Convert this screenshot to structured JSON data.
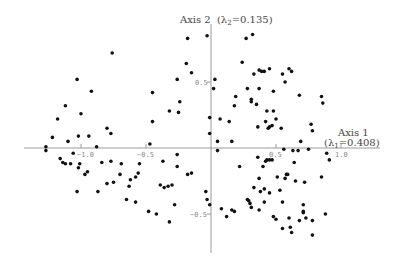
{
  "chart_data": {
    "type": "scatter",
    "title": "",
    "xlabel": "Axis 1",
    "xlabel_sub": "(λ1 = 0.408)",
    "ylabel": "Axis 2 (λ2 = 0.135)",
    "xlim": [
      -1.45,
      1.3
    ],
    "ylim": [
      -0.8,
      0.95
    ],
    "grid": false,
    "legend": null,
    "x_ticks": [
      -1.0,
      -0.5,
      0.5,
      1.0
    ],
    "x_tick_labels": [
      "−1.0",
      "−0.5",
      "0.5",
      "1.0"
    ],
    "y_ticks": [
      0.5,
      -0.5
    ],
    "y_tick_labels": [
      "0.5",
      "−0.5"
    ],
    "points": [
      [
        -0.18,
        0.83
      ],
      [
        -0.76,
        0.72
      ],
      [
        -1.03,
        0.52
      ],
      [
        -0.92,
        0.43
      ],
      [
        -1.12,
        0.32
      ],
      [
        -1.0,
        0.26
      ],
      [
        -1.18,
        0.22
      ],
      [
        -1.22,
        0.08
      ],
      [
        -1.1,
        0.05
      ],
      [
        -1.02,
        0.09
      ],
      [
        -0.94,
        0.09
      ],
      [
        -0.8,
        0.15
      ],
      [
        -0.77,
        0.11
      ],
      [
        -0.88,
        0.01
      ],
      [
        -0.45,
        0.42
      ],
      [
        -0.45,
        0.2
      ],
      [
        -0.47,
        0.03
      ],
      [
        -0.32,
        0.28
      ],
      [
        -1.27,
        0.01
      ],
      [
        -0.19,
        0.64
      ],
      [
        -0.15,
        0.57
      ],
      [
        -0.26,
        0.52
      ],
      [
        -0.24,
        0.35
      ],
      [
        -0.25,
        0.27
      ],
      [
        -0.03,
        0.85
      ],
      [
        0.27,
        0.83
      ],
      [
        0.32,
        0.86
      ],
      [
        0.24,
        0.65
      ],
      [
        0.03,
        0.52
      ],
      [
        0.02,
        0.45
      ],
      [
        0.33,
        0.56
      ],
      [
        0.37,
        0.59
      ],
      [
        0.39,
        0.58
      ],
      [
        0.41,
        0.58
      ],
      [
        0.45,
        0.6
      ],
      [
        0.55,
        0.56
      ],
      [
        0.57,
        0.5
      ],
      [
        0.6,
        0.6
      ],
      [
        0.62,
        0.58
      ],
      [
        0.28,
        0.45
      ],
      [
        0.37,
        0.45
      ],
      [
        0.48,
        0.43
      ],
      [
        0.68,
        0.4
      ],
      [
        0.85,
        0.39
      ],
      [
        0.86,
        0.34
      ],
      [
        0.19,
        0.39
      ],
      [
        0.31,
        0.37
      ],
      [
        0.31,
        0.35
      ],
      [
        0.35,
        0.33
      ],
      [
        0.18,
        0.32
      ],
      [
        0.43,
        0.28
      ],
      [
        0.48,
        0.28
      ],
      [
        0.5,
        0.22
      ],
      [
        0.42,
        0.2
      ],
      [
        0.36,
        0.16
      ],
      [
        0.44,
        0.15
      ],
      [
        0.45,
        0.16
      ],
      [
        0.47,
        0.17
      ],
      [
        0.54,
        0.15
      ],
      [
        0.77,
        0.18
      ],
      [
        0.78,
        0.13
      ],
      [
        -0.01,
        0.23
      ],
      [
        0.07,
        0.22
      ],
      [
        0.14,
        0.2
      ],
      [
        -0.01,
        0.11
      ],
      [
        0.05,
        0.05
      ],
      [
        0.16,
        0.05
      ],
      [
        0.69,
        0.05
      ],
      [
        0.75,
        -0.01
      ],
      [
        0.56,
        -0.01
      ],
      [
        -1.27,
        -0.02
      ],
      [
        -1.06,
        -0.04
      ],
      [
        -1.16,
        -0.08
      ],
      [
        -1.14,
        -0.11
      ],
      [
        -1.12,
        -0.12
      ],
      [
        -1.08,
        -0.12
      ],
      [
        -1.01,
        -0.12
      ],
      [
        -0.84,
        -0.11
      ],
      [
        -0.77,
        -0.1
      ],
      [
        -0.69,
        -0.12
      ],
      [
        -0.55,
        -0.12
      ],
      [
        -0.26,
        -0.05
      ],
      [
        -0.26,
        -0.14
      ],
      [
        -0.37,
        -0.1
      ],
      [
        -0.97,
        -0.2
      ],
      [
        -0.95,
        -0.18
      ],
      [
        -1.02,
        -0.15
      ],
      [
        -0.7,
        -0.2
      ],
      [
        -0.75,
        -0.26
      ],
      [
        -0.8,
        -0.27
      ],
      [
        -0.62,
        -0.24
      ],
      [
        -0.58,
        -0.22
      ],
      [
        -0.56,
        -0.19
      ],
      [
        -0.63,
        -0.29
      ],
      [
        -0.39,
        -0.28
      ],
      [
        -0.36,
        -0.3
      ],
      [
        -0.33,
        -0.29
      ],
      [
        -0.3,
        -0.28
      ],
      [
        -1.03,
        -0.33
      ],
      [
        -0.87,
        -0.33
      ],
      [
        -0.65,
        -0.39
      ],
      [
        -0.58,
        -0.41
      ],
      [
        -0.48,
        -0.48
      ],
      [
        -0.42,
        -0.5
      ],
      [
        -0.32,
        -0.56
      ],
      [
        -0.28,
        -0.43
      ],
      [
        -0.18,
        -0.2
      ],
      [
        -0.15,
        -0.19
      ],
      [
        -0.04,
        -0.33
      ],
      [
        -0.03,
        -0.39
      ],
      [
        -0.01,
        -0.43
      ],
      [
        0.08,
        -0.46
      ],
      [
        0.12,
        -0.52
      ],
      [
        0.16,
        -0.47
      ],
      [
        0.18,
        -0.48
      ],
      [
        0.05,
        -0.02
      ],
      [
        0.22,
        -0.14
      ],
      [
        0.28,
        -0.39
      ],
      [
        0.3,
        -0.42
      ],
      [
        0.36,
        -0.07
      ],
      [
        0.42,
        -0.1
      ],
      [
        0.43,
        -0.09
      ],
      [
        0.45,
        -0.09
      ],
      [
        0.47,
        -0.09
      ],
      [
        0.4,
        -0.14
      ],
      [
        0.63,
        -0.02
      ],
      [
        0.67,
        -0.02
      ],
      [
        0.89,
        -0.04
      ],
      [
        0.91,
        -0.09
      ],
      [
        0.64,
        -0.11
      ],
      [
        0.37,
        -0.23
      ],
      [
        0.51,
        -0.22
      ],
      [
        0.57,
        -0.23
      ],
      [
        0.58,
        -0.2
      ],
      [
        0.59,
        -0.2
      ],
      [
        0.65,
        -0.25
      ],
      [
        0.72,
        -0.26
      ],
      [
        0.85,
        -0.22
      ],
      [
        0.33,
        -0.3
      ],
      [
        0.38,
        -0.33
      ],
      [
        0.41,
        -0.31
      ],
      [
        0.45,
        -0.34
      ],
      [
        0.29,
        -0.4
      ],
      [
        0.31,
        -0.45
      ],
      [
        0.41,
        -0.41
      ],
      [
        0.37,
        -0.47
      ],
      [
        0.55,
        -0.41
      ],
      [
        0.53,
        -0.32
      ],
      [
        0.71,
        -0.43
      ],
      [
        0.71,
        -0.48
      ],
      [
        0.71,
        -0.49
      ],
      [
        0.73,
        -0.53
      ],
      [
        0.68,
        -0.55
      ],
      [
        0.78,
        -0.55
      ],
      [
        0.48,
        -0.52
      ],
      [
        0.5,
        -0.54
      ],
      [
        0.6,
        -0.53
      ],
      [
        0.55,
        -0.61
      ],
      [
        0.61,
        -0.6
      ],
      [
        0.62,
        -0.64
      ],
      [
        0.78,
        -0.66
      ],
      [
        0.88,
        -0.5
      ]
    ]
  },
  "labels": {
    "axis1_title": "Axis 1",
    "axis1_lambda": "(λ",
    "axis1_lambda_sub": "1",
    "axis1_lambda_val": "=0.408)",
    "axis2_title": "Axis 2",
    "axis2_lambda": "(λ",
    "axis2_lambda_sub": "2",
    "axis2_lambda_val": "=0.135)",
    "tick_x_m10": "−1.0",
    "tick_x_m05": "−0.5",
    "tick_x_05": "0.5",
    "tick_x_10": "1.0",
    "tick_y_05": "0.5",
    "tick_y_m05": "−0.5"
  }
}
